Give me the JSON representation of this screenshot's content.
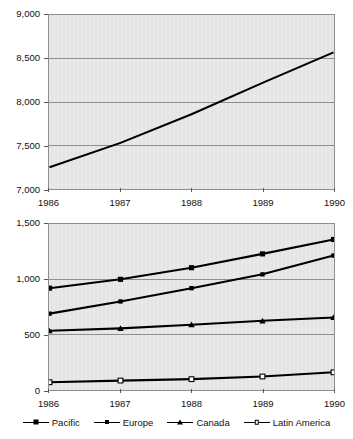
{
  "top_clip": {
    "ghost_left": "",
    "ghost_right": ""
  },
  "legend": {
    "items": [
      {
        "label": "Pacific",
        "marker": "filled-square"
      },
      {
        "label": "Europe",
        "marker": "filled-square-small"
      },
      {
        "label": "Canada",
        "marker": "filled-triangle"
      },
      {
        "label": "Latin America",
        "marker": "open-square"
      }
    ]
  },
  "chart_data": [
    {
      "id": "top",
      "type": "line",
      "title": "",
      "xlabel": "",
      "ylabel": "",
      "categories": [
        "1986",
        "1987",
        "1988",
        "1989",
        "1990"
      ],
      "x": [
        1986,
        1987,
        1988,
        1989,
        1990
      ],
      "ylim": [
        7000,
        9000
      ],
      "yticks": [
        7000,
        7500,
        8000,
        8500,
        9000
      ],
      "ytick_labels": [
        "7,000",
        "7,500",
        "8,000",
        "8,500",
        "9,000"
      ],
      "grid": true,
      "legend": "none",
      "series": [
        {
          "name": "Total",
          "marker": "none",
          "values": [
            7250,
            7530,
            7860,
            8220,
            8570
          ]
        }
      ]
    },
    {
      "id": "bottom",
      "type": "line",
      "title": "",
      "xlabel": "",
      "ylabel": "",
      "categories": [
        "1986",
        "1987",
        "1988",
        "1989",
        "1990"
      ],
      "x": [
        1986,
        1987,
        1988,
        1989,
        1990
      ],
      "ylim": [
        0,
        1500
      ],
      "yticks": [
        0,
        500,
        1000,
        1500
      ],
      "ytick_labels": [
        "0",
        "500",
        "1,000",
        "1,500"
      ],
      "grid": true,
      "legend": "bottom",
      "series": [
        {
          "name": "Pacific",
          "marker": "filled-square",
          "values": [
            920,
            1000,
            1105,
            1230,
            1360
          ]
        },
        {
          "name": "Europe",
          "marker": "filled-square-small",
          "values": [
            690,
            800,
            920,
            1045,
            1215
          ]
        },
        {
          "name": "Canada",
          "marker": "filled-triangle",
          "values": [
            535,
            557,
            590,
            625,
            655
          ]
        },
        {
          "name": "Latin America",
          "marker": "open-square",
          "values": [
            70,
            85,
            98,
            122,
            160
          ]
        }
      ]
    }
  ],
  "colors": {
    "line": "#000000",
    "plot_background": "#e7e7e7",
    "grid": "#8e8e8e",
    "axis_text": "#111111",
    "page_background": "#ffffff"
  }
}
